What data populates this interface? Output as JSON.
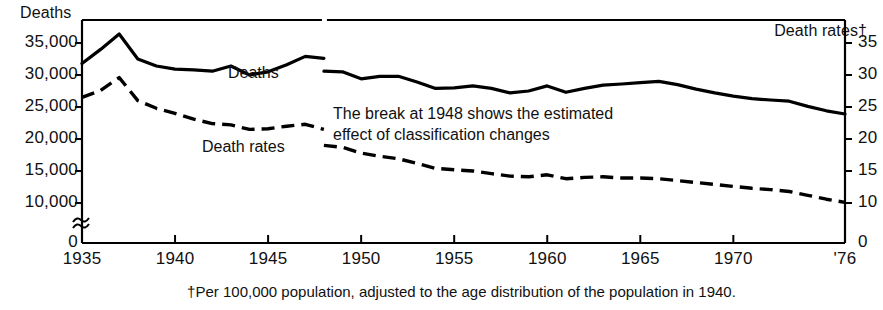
{
  "chart_data": {
    "type": "line",
    "title": "",
    "xlabel": "",
    "ylabel": "Deaths",
    "ylabel_right": "Death rates†",
    "footnote": "†Per 100,000 population, adjusted to the age distribution of the population in 1940.",
    "annotation": [
      "The break at 1948 shows the estimated",
      "effect of classification changes"
    ],
    "grid": false,
    "legend_position": "inline-labels",
    "axis_break_left": true,
    "xlim": [
      1935,
      1976
    ],
    "xticks": [
      1935,
      1940,
      1945,
      1950,
      1955,
      1960,
      1965,
      1970,
      1976
    ],
    "xticklabels": [
      "1935",
      "1940",
      "1945",
      "1950",
      "1955",
      "1960",
      "1965",
      "1970",
      "'76"
    ],
    "ylim_left": [
      0,
      37000
    ],
    "yticks_left": [
      0,
      10000,
      15000,
      20000,
      25000,
      30000,
      35000
    ],
    "yticklabels_left": [
      "0",
      "10,000",
      "15,000",
      "20,000",
      "25,000",
      "30,000",
      "35,000"
    ],
    "ylim_right": [
      0,
      37
    ],
    "yticks_right": [
      0,
      10,
      15,
      20,
      25,
      30,
      35
    ],
    "yticklabels_right": [
      "0",
      "10",
      "15",
      "20",
      "25",
      "30",
      "35"
    ],
    "break_year": 1948,
    "series": [
      {
        "name": "Deaths",
        "style": "solid",
        "axis": "left",
        "color": "#000000",
        "segments": [
          {
            "x": [
              1935,
              1936,
              1937,
              1938,
              1939,
              1940,
              1941,
              1942,
              1943,
              1944,
              1945,
              1946,
              1947,
              1948
            ],
            "values": [
              31800,
              34000,
              36400,
              32500,
              31400,
              30900,
              30800,
              30600,
              31400,
              30000,
              30500,
              31600,
              32900,
              32600
            ]
          },
          {
            "x": [
              1948,
              1949,
              1950,
              1951,
              1952,
              1953,
              1954,
              1955,
              1956,
              1957,
              1958,
              1959,
              1960,
              1961,
              1962,
              1963,
              1964,
              1965,
              1966,
              1967,
              1968,
              1969,
              1970,
              1971,
              1972,
              1973,
              1974,
              1975,
              1976
            ],
            "values": [
              30600,
              30500,
              29400,
              29800,
              29800,
              28900,
              27900,
              28000,
              28300,
              27900,
              27200,
              27500,
              28300,
              27300,
              27900,
              28400,
              28600,
              28800,
              29000,
              28500,
              27800,
              27200,
              26700,
              26300,
              26100,
              25900,
              25100,
              24400,
              23900
            ]
          }
        ]
      },
      {
        "name": "Death rates",
        "style": "dashed",
        "axis": "right",
        "color": "#000000",
        "segments": [
          {
            "x": [
              1935,
              1936,
              1937,
              1938,
              1939,
              1940,
              1941,
              1942,
              1943,
              1944,
              1945,
              1946,
              1947,
              1948
            ],
            "values": [
              26.5,
              27.6,
              29.6,
              26.0,
              24.8,
              24.0,
              23.1,
              22.4,
              22.2,
              21.5,
              21.6,
              22.0,
              22.3,
              21.5
            ]
          },
          {
            "x": [
              1948,
              1949,
              1950,
              1951,
              1952,
              1953,
              1954,
              1955,
              1956,
              1957,
              1958,
              1959,
              1960,
              1961,
              1962,
              1963,
              1964,
              1965,
              1966,
              1967,
              1968,
              1969,
              1970,
              1971,
              1972,
              1973,
              1974,
              1975,
              1976
            ],
            "values": [
              19.0,
              18.7,
              17.8,
              17.3,
              16.9,
              16.2,
              15.4,
              15.2,
              15.0,
              14.6,
              14.2,
              14.1,
              14.4,
              13.8,
              14.0,
              14.1,
              13.9,
              13.9,
              13.8,
              13.5,
              13.2,
              12.9,
              12.6,
              12.3,
              12.1,
              11.8,
              11.2,
              10.6,
              10.1
            ]
          }
        ]
      }
    ]
  },
  "labels": {
    "deaths_series": "Deaths",
    "rates_series": "Death rates"
  }
}
